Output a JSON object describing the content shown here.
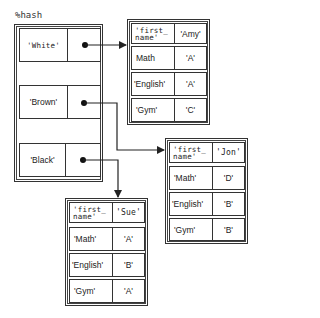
{
  "hash": {
    "label": "%hash",
    "entries": [
      {
        "key": "'White'",
        "target": "amy"
      },
      {
        "key": "'Brown'",
        "target": "jon"
      },
      {
        "key": "'Black'",
        "target": "sue"
      }
    ]
  },
  "records": {
    "amy": {
      "rows": [
        {
          "key": "'first_\nname'",
          "value": "'Amy'"
        },
        {
          "key": "Math",
          "value": "'A'"
        },
        {
          "key": "'English'",
          "value": "'A'"
        },
        {
          "key": "'Gym'",
          "value": "'C'"
        }
      ]
    },
    "jon": {
      "rows": [
        {
          "key": "'first_\nname'",
          "value": "'Jon'"
        },
        {
          "key": "'Math'",
          "value": "'D'"
        },
        {
          "key": "'English'",
          "value": "'B'"
        },
        {
          "key": "'Gym'",
          "value": "'B'"
        }
      ]
    },
    "sue": {
      "rows": [
        {
          "key": "'first_\nname'",
          "value": "'Sue'"
        },
        {
          "key": "'Math'",
          "value": "'A'"
        },
        {
          "key": "'English'",
          "value": "'B'"
        },
        {
          "key": "'Gym'",
          "value": "'A'"
        }
      ]
    }
  },
  "colors": {
    "line": "#222222",
    "background": "#ffffff"
  }
}
